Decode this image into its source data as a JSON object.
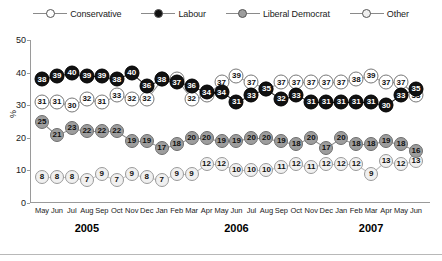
{
  "legend": {
    "position": "top-center",
    "items": [
      {
        "label": "Conservative",
        "key": "conservative",
        "icon": "open-circle-marker",
        "color": "#ffffff"
      },
      {
        "label": "Labour",
        "key": "labour",
        "icon": "filled-circle-marker",
        "color": "#111111"
      },
      {
        "label": "Liberal Democrat",
        "key": "liberal_democrat",
        "icon": "grey-circle-marker",
        "color": "#9d9d9d"
      },
      {
        "label": "Other",
        "key": "other",
        "icon": "light-circle-marker",
        "color": "#f0f0f0"
      }
    ]
  },
  "axes": {
    "ylabel": "%",
    "yticks": [
      0,
      10,
      20,
      30,
      40,
      50
    ],
    "ylim": [
      0,
      50
    ],
    "grid": false
  },
  "years": [
    {
      "label": "2005",
      "center_month_index": 3
    },
    {
      "label": "2006",
      "center_month_index": 13
    },
    {
      "label": "2007",
      "center_month_index": 22
    }
  ],
  "chart_data": {
    "type": "line",
    "title": "",
    "subtitle": "",
    "xlabel": "",
    "ylabel": "%",
    "ylim": [
      0,
      50
    ],
    "yticks": [
      0,
      10,
      20,
      30,
      40,
      50
    ],
    "grid": false,
    "legend_position": "top-center",
    "categories": [
      "May",
      "Jun",
      "Jul",
      "Aug",
      "Sep",
      "Oct",
      "Nov",
      "Dec",
      "Jan",
      "Feb",
      "Mar",
      "Apr",
      "May",
      "Jun",
      "Jul",
      "Aug",
      "Sep",
      "Oct",
      "Nov",
      "Dec",
      "Jan",
      "Feb",
      "Mar",
      "Apr",
      "May",
      "Jun"
    ],
    "x_years": [
      "2005",
      "2005",
      "2005",
      "2005",
      "2005",
      "2005",
      "2005",
      "2005",
      "2006",
      "2006",
      "2006",
      "2006",
      "2006",
      "2006",
      "2006",
      "2006",
      "2006",
      "2006",
      "2006",
      "2006",
      "2007",
      "2007",
      "2007",
      "2007",
      "2007",
      "2007"
    ],
    "series": [
      {
        "name": "Conservative",
        "marker": "open-circle",
        "values": [
          31,
          31,
          30,
          32,
          31,
          33,
          32,
          32,
          38,
          38,
          32,
          33,
          37,
          39,
          37,
          35,
          37,
          37,
          37,
          37,
          37,
          38,
          39,
          37,
          37,
          33
        ]
      },
      {
        "name": "Labour",
        "marker": "filled-circle",
        "values": [
          38,
          39,
          40,
          39,
          39,
          38,
          40,
          36,
          38,
          37,
          36,
          34,
          34,
          31,
          33,
          35,
          32,
          33,
          31,
          31,
          31,
          31,
          31,
          30,
          33,
          35
        ]
      },
      {
        "name": "Liberal Democrat",
        "marker": "grey-circle",
        "values": [
          25,
          21,
          23,
          22,
          22,
          22,
          19,
          19,
          17,
          18,
          20,
          20,
          19,
          19,
          20,
          20,
          19,
          18,
          20,
          17,
          20,
          18,
          18,
          19,
          18,
          16
        ]
      },
      {
        "name": "Other",
        "marker": "light-circle",
        "values": [
          8,
          8,
          8,
          7,
          9,
          7,
          9,
          8,
          7,
          9,
          9,
          12,
          12,
          10,
          10,
          10,
          11,
          12,
          11,
          12,
          12,
          12,
          9,
          13,
          12,
          13
        ]
      }
    ]
  }
}
